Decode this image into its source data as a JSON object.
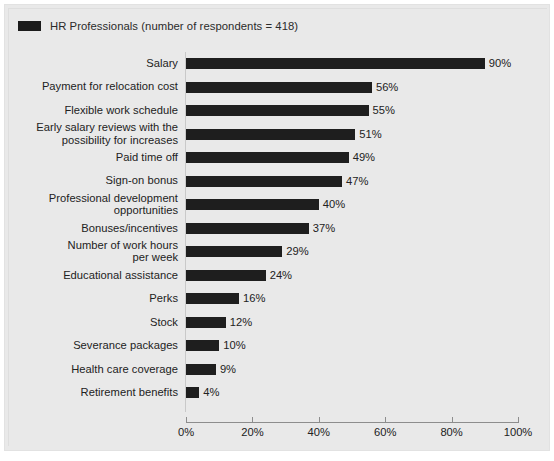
{
  "legend": {
    "label": "HR Professionals (number of respondents = 418)",
    "swatch_color": "#1e1e1e",
    "icon": "legend-swatch-square"
  },
  "axis": {
    "x_ticks": [
      "0%",
      "20%",
      "40%",
      "60%",
      "80%",
      "100%"
    ]
  },
  "chart_data": {
    "type": "bar",
    "orientation": "horizontal",
    "title": "",
    "subtitle": "",
    "xlabel": "",
    "ylabel": "",
    "xlim": [
      0,
      100
    ],
    "xticks": [
      0,
      20,
      40,
      60,
      80,
      100
    ],
    "xtick_labels": [
      "0%",
      "20%",
      "40%",
      "60%",
      "80%",
      "100%"
    ],
    "grid": false,
    "legend_position": "top-left",
    "value_suffix": "%",
    "series": [
      {
        "name": "HR Professionals (number of respondents = 418)",
        "color": "#1e1e1e",
        "values": [
          90,
          56,
          55,
          51,
          49,
          47,
          40,
          37,
          29,
          24,
          16,
          12,
          10,
          9,
          4
        ]
      }
    ],
    "categories": [
      "Salary",
      "Payment for relocation cost",
      "Flexible work schedule",
      "Early salary reviews with the possibility for increases",
      "Paid time off",
      "Sign-on bonus",
      "Professional development opportunities",
      "Bonuses/incentives",
      "Number of work hours per week",
      "Educational assistance",
      "Perks",
      "Stock",
      "Severance packages",
      "Health care coverage",
      "Retirement benefits"
    ],
    "bars": [
      {
        "category": "Salary",
        "category_display": "Salary",
        "value": 90,
        "label": "90%"
      },
      {
        "category": "Payment for relocation cost",
        "category_display": "Payment for relocation cost",
        "value": 56,
        "label": "56%"
      },
      {
        "category": "Flexible work schedule",
        "category_display": "Flexible work schedule",
        "value": 55,
        "label": "55%"
      },
      {
        "category": "Early salary reviews with the possibility for increases",
        "category_display": "Early salary reviews with the\npossibility for increases",
        "value": 51,
        "label": "51%"
      },
      {
        "category": "Paid time off",
        "category_display": "Paid time off",
        "value": 49,
        "label": "49%"
      },
      {
        "category": "Sign-on bonus",
        "category_display": "Sign-on bonus",
        "value": 47,
        "label": "47%"
      },
      {
        "category": "Professional development opportunities",
        "category_display": "Professional development\nopportunities",
        "value": 40,
        "label": "40%"
      },
      {
        "category": "Bonuses/incentives",
        "category_display": "Bonuses/incentives",
        "value": 37,
        "label": "37%"
      },
      {
        "category": "Number of work hours per week",
        "category_display": "Number of work hours\nper week",
        "value": 29,
        "label": "29%"
      },
      {
        "category": "Educational assistance",
        "category_display": "Educational assistance",
        "value": 24,
        "label": "24%"
      },
      {
        "category": "Perks",
        "category_display": "Perks",
        "value": 16,
        "label": "16%"
      },
      {
        "category": "Stock",
        "category_display": "Stock",
        "value": 12,
        "label": "12%"
      },
      {
        "category": "Severance packages",
        "category_display": "Severance packages",
        "value": 10,
        "label": "10%"
      },
      {
        "category": "Health care coverage",
        "category_display": "Health care coverage",
        "value": 9,
        "label": "9%"
      },
      {
        "category": "Retirement benefits",
        "category_display": "Retirement benefits",
        "value": 4,
        "label": "4%"
      }
    ]
  }
}
